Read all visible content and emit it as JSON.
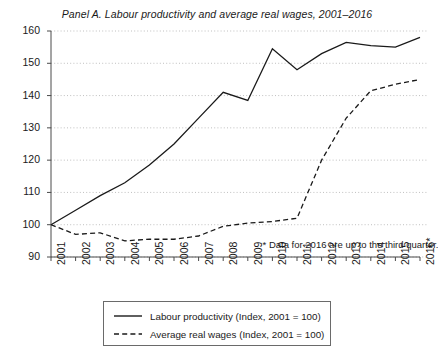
{
  "chart_data": {
    "type": "line",
    "title": "Panel A. Labour productivity and average real wages, 2001–2016",
    "xlabel": "",
    "ylabel": "",
    "categories": [
      "2001",
      "2002",
      "2003",
      "2004",
      "2005",
      "2006",
      "2007",
      "2008",
      "2009",
      "2010",
      "2011",
      "2012",
      "2013",
      "2014",
      "2015",
      "2016*"
    ],
    "xlim": [
      2001,
      2016
    ],
    "ylim": [
      90,
      160
    ],
    "yticks": [
      90,
      100,
      110,
      120,
      130,
      140,
      150,
      160
    ],
    "grid": "horizontal-dotted",
    "legend_position": "below-plot",
    "series": [
      {
        "name": "Labour productivity (Index, 2001 = 100)",
        "style": "solid",
        "color": "#1a1a1a",
        "values": [
          100.0,
          104.5,
          109.0,
          113.0,
          118.5,
          125.0,
          133.0,
          141.0,
          138.5,
          154.5,
          148.0,
          153.0,
          156.5,
          155.5,
          155.0,
          158.0
        ]
      },
      {
        "name": "Average real wages (Index, 2001 = 100)",
        "style": "dashed",
        "color": "#1a1a1a",
        "values": [
          100.0,
          97.0,
          97.5,
          95.0,
          95.5,
          95.5,
          96.5,
          99.5,
          100.5,
          101.0,
          102.0,
          120.0,
          133.0,
          141.5,
          143.5,
          145.0
        ]
      }
    ],
    "annotations": [
      {
        "text": "* Data for 2016 are up to the third quarter.",
        "x": 2009.6,
        "y": 93.2
      }
    ]
  },
  "legend": {
    "items": [
      {
        "label": "Labour productivity (Index, 2001 = 100)",
        "style": "solid"
      },
      {
        "label": "Average real wages (Index, 2001 = 100)",
        "style": "dashed"
      }
    ]
  }
}
